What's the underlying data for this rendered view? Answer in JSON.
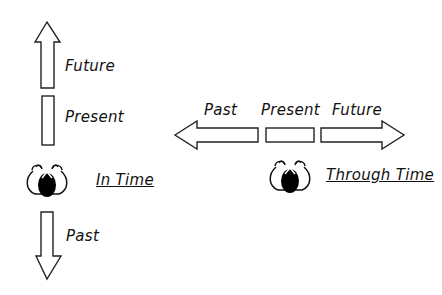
{
  "diagram": {
    "in_time": {
      "title": "In Time",
      "labels": {
        "future": "Future",
        "present": "Present",
        "past": "Past"
      },
      "orientation": "vertical"
    },
    "through_time": {
      "title": "Through Time",
      "labels": {
        "past": "Past",
        "present": "Present",
        "future": "Future"
      },
      "orientation": "horizontal"
    },
    "colors": {
      "stroke": "#222222",
      "fill": "#ffffff",
      "figure": "#000000"
    }
  }
}
